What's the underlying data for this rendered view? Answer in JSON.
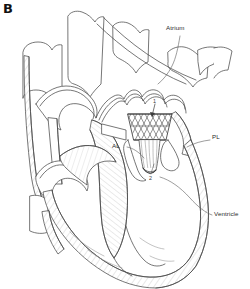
{
  "figure": {
    "panel_letter": "B",
    "type": "medical-line-illustration",
    "background_color": "#ffffff",
    "line_color": "#4a4a4a",
    "hatch_color": "#b9b9b9",
    "label_color": "#2b2b2b"
  },
  "labels": {
    "atrium": "Atrium",
    "ventricle": "Ventricle",
    "posterior_leaflet": "PL",
    "anterior_leaflet": "AL"
  },
  "callouts": {
    "one": "1",
    "two": "2"
  }
}
